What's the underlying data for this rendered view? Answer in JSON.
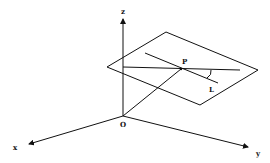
{
  "diagram": {
    "axes": {
      "x_label": "x",
      "y_label": "y",
      "z_label": "z",
      "origin_label": "O"
    },
    "plane": {
      "point_label": "P",
      "line_label": "L"
    },
    "stroke_color": "#111111",
    "background": "#ffffff"
  }
}
